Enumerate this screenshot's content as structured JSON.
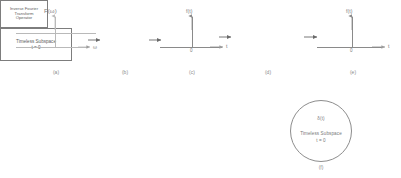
{
  "figure": {
    "type": "signal-flow-block-diagram",
    "background_color": "#ffffff",
    "stroke_color": "#8a8a8a",
    "text_color": "#6f6f6f"
  },
  "panels": [
    {
      "id": "a",
      "caption": "(a)",
      "kind": "plot",
      "signal_label": "F(ω)",
      "x_axis_label": "ω",
      "description": "flat constant spectrum extending over ω axis"
    },
    {
      "id": "b",
      "caption": "(b)",
      "kind": "block",
      "lines": [
        "Inverse Fourier",
        "Transform",
        "Operator"
      ]
    },
    {
      "id": "c",
      "caption": "(c)",
      "kind": "plot",
      "signal_label": "f(t)",
      "x_axis_label": "t",
      "origin_label": "0",
      "description": "impulse (delta) at t = 0"
    },
    {
      "id": "d",
      "caption": "(d)",
      "kind": "block",
      "lines": [
        "Timeless Subspace",
        "t = 0"
      ]
    },
    {
      "id": "e",
      "caption": "(e)",
      "kind": "plot",
      "signal_label": "f(t)",
      "x_axis_label": "t",
      "origin_label": "0",
      "description": "impulse (delta) at t = 0"
    },
    {
      "id": "f",
      "caption": "(f)",
      "kind": "circle",
      "lines": [
        "δ(t)",
        "Timeless Subspace",
        "t = 0"
      ]
    }
  ],
  "labels": {
    "panel_a_signal": "F(ω)",
    "panel_a_axis": "ω",
    "panel_c_signal": "f(t)",
    "panel_c_axis": "t",
    "panel_c_origin": "0",
    "panel_e_signal": "f(t)",
    "panel_e_axis": "t",
    "panel_e_origin": "0",
    "block_b_line1": "Inverse Fourier",
    "block_b_line2": "Transform",
    "block_b_line3": "Operator",
    "block_d_line1": "Timeless Subspace",
    "block_d_line2": "t = 0",
    "circle_f_delta": "δ(t)",
    "circle_f_line1": "Timeless Subspace",
    "circle_f_line2": "t = 0",
    "caption_a": "(a)",
    "caption_b": "(b)",
    "caption_c": "(c)",
    "caption_d": "(d)",
    "caption_e": "(e)",
    "caption_f": "(f)"
  }
}
